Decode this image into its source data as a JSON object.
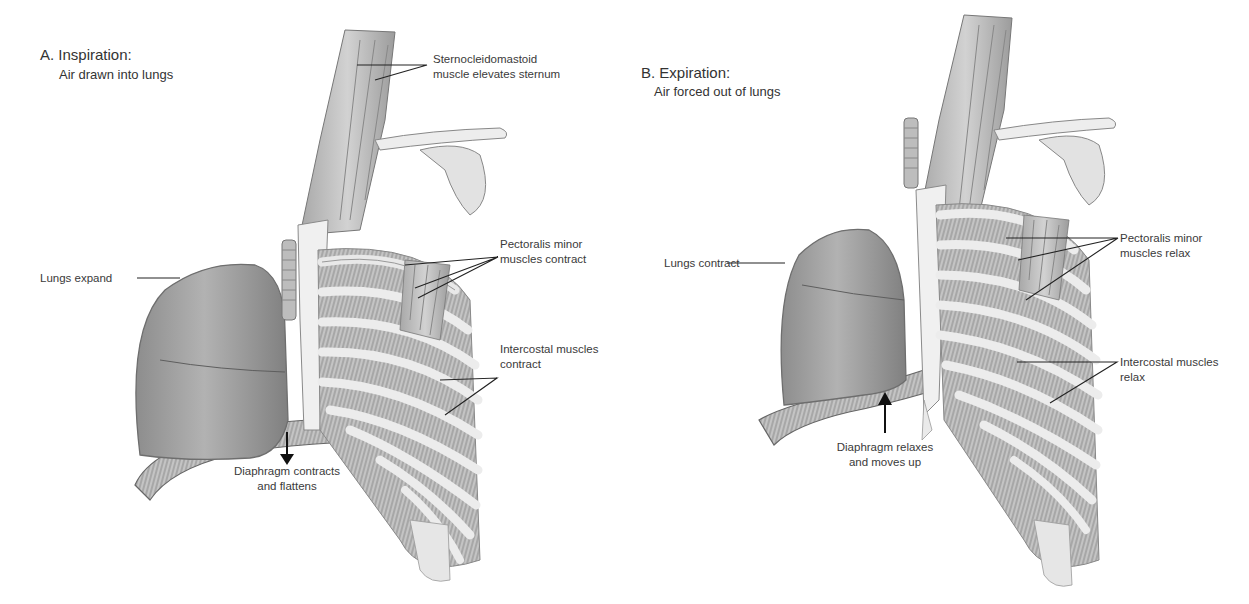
{
  "figure": {
    "panels": [
      {
        "id": "A",
        "title": "A. Inspiration:",
        "subtitle": "Air drawn into lungs",
        "labels": {
          "scm": [
            "Sternocleidomastoid",
            "muscle elevates sternum"
          ],
          "pectoralis": [
            "Pectoralis minor",
            "muscles contract"
          ],
          "lungs": "Lungs expand",
          "intercostal": [
            "Intercostal muscles",
            "contract"
          ],
          "diaphragm": [
            "Diaphragm contracts",
            "and flattens"
          ]
        },
        "diaphragm_arrow": "down-arrow"
      },
      {
        "id": "B",
        "title": "B. Expiration:",
        "subtitle": "Air forced out of lungs",
        "labels": {
          "pectoralis": [
            "Pectoralis minor",
            "muscles relax"
          ],
          "lungs": "Lungs contract",
          "intercostal": [
            "Intercostal muscles",
            "relax"
          ],
          "diaphragm": [
            "Diaphragm relaxes",
            "and moves up"
          ]
        },
        "diaphragm_arrow": "up-arrow"
      }
    ],
    "colors": {
      "background": "#ffffff",
      "text": "#3a3a3a",
      "leader_line": "#222222",
      "lung_fill": "#9a9a9a",
      "muscle_fill": "#b5b5b5",
      "bone_fill": "#ececec",
      "outline": "#6e6e6e"
    }
  }
}
